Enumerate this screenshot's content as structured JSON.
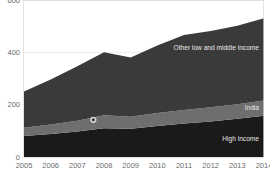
{
  "chart_data": {
    "type": "area",
    "stacked": true,
    "title": "",
    "subtitle": "",
    "xlabel": "",
    "ylabel": "",
    "categories": [
      "2005",
      "2006",
      "2007",
      "2008",
      "2009",
      "2010",
      "2011",
      "2012",
      "2013",
      "2014"
    ],
    "x": [
      2005,
      2006,
      2007,
      2008,
      2009,
      2010,
      2011,
      2012,
      2013,
      2014
    ],
    "xlim": [
      2005,
      2014
    ],
    "ylim": [
      0,
      600
    ],
    "yticks": [
      0,
      200,
      400,
      600
    ],
    "ytick_labels": [
      "0",
      "200",
      "400",
      "600"
    ],
    "grid": true,
    "grid_axis": "y",
    "legend": "inline-labels",
    "series": [
      {
        "name": "High income",
        "color": "#1a1a1a",
        "label_position": "inside-right",
        "values": [
          80,
          88,
          97,
          110,
          108,
          118,
          128,
          136,
          146,
          158
        ]
      },
      {
        "name": "India",
        "color": "#6e6e6e",
        "label_position": "inside-right",
        "values": [
          32,
          36,
          42,
          50,
          46,
          50,
          52,
          54,
          56,
          58
        ]
      },
      {
        "name": "Other low and middle income",
        "color": "#3a3a3a",
        "label_position": "inside-right",
        "values": [
          138,
          172,
          208,
          240,
          226,
          258,
          286,
          292,
          300,
          314
        ]
      }
    ],
    "totals": [
      250,
      296,
      347,
      400,
      380,
      426,
      466,
      482,
      502,
      530
    ],
    "annotations": [
      {
        "type": "point-marker",
        "shape": "circle",
        "x": 2007.6,
        "y": 142,
        "fill": "#2f2f2f",
        "ring": "#d9d9d9",
        "label": ""
      }
    ]
  },
  "axis": {
    "y_tick_labels": [
      "600",
      "400",
      "200",
      "0"
    ],
    "x_tick_labels": [
      "2005",
      "2006",
      "2007",
      "2008",
      "2009",
      "2010",
      "2011",
      "2012",
      "2013",
      "2014"
    ]
  },
  "series_labels": {
    "other": "Other low and middle income",
    "india": "India",
    "high_income": "High income"
  },
  "colors": {
    "high_income": "#1a1a1a",
    "india": "#6e6e6e",
    "other_low_middle": "#3a3a3a",
    "gridline": "#e3e3e3",
    "tick_text": "#6b6b6b",
    "series_text": "#e8e8e8",
    "background": "#ffffff"
  }
}
